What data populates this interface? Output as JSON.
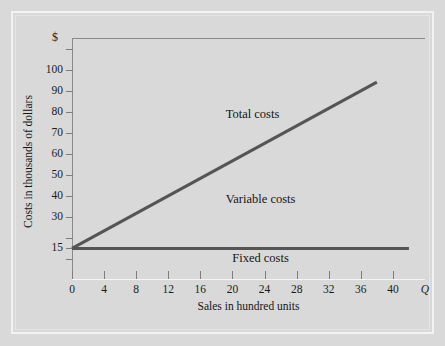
{
  "chart_data": {
    "type": "line",
    "title": "",
    "xlabel": "Sales in hundred units",
    "ylabel": "Costs in thousands of dollars",
    "y_unit_symbol": "$",
    "x_axis_end_symbol": "Q",
    "xlim": [
      0,
      44
    ],
    "ylim": [
      0,
      115
    ],
    "xticks": [
      0,
      4,
      8,
      12,
      16,
      20,
      24,
      28,
      32,
      36,
      40
    ],
    "xtick_labels": [
      "0",
      "4",
      "8",
      "12",
      "16",
      "20",
      "24",
      "28",
      "32",
      "36",
      "40"
    ],
    "yticks": [
      110,
      100,
      90,
      80,
      70,
      60,
      50,
      40,
      30,
      20,
      15,
      10
    ],
    "ytick_labels": [
      "",
      "100",
      "90",
      "80",
      "70",
      "60",
      "50",
      "40",
      "30",
      "",
      "15",
      ""
    ],
    "grid": false,
    "legend_position": "inline-annotations",
    "series": [
      {
        "name": "Total costs",
        "label": "Total costs",
        "x": [
          0,
          38
        ],
        "values": [
          15,
          94
        ],
        "color": "#555555",
        "width": 3
      },
      {
        "name": "Fixed costs",
        "label": "Fixed costs",
        "x": [
          0,
          42
        ],
        "values": [
          15,
          15
        ],
        "color": "#555555",
        "width": 3
      }
    ],
    "annotations": [
      {
        "text": "Total costs",
        "x": 22.5,
        "y": 79
      },
      {
        "text": "Variable costs",
        "x": 23.5,
        "y": 38.5
      },
      {
        "text": "Fixed costs",
        "x": 23.5,
        "y": 10.5
      }
    ],
    "colors": {
      "background": "#d9d9d9",
      "line": "#555555",
      "axis": "#8a8a8a",
      "text": "#151515"
    }
  }
}
